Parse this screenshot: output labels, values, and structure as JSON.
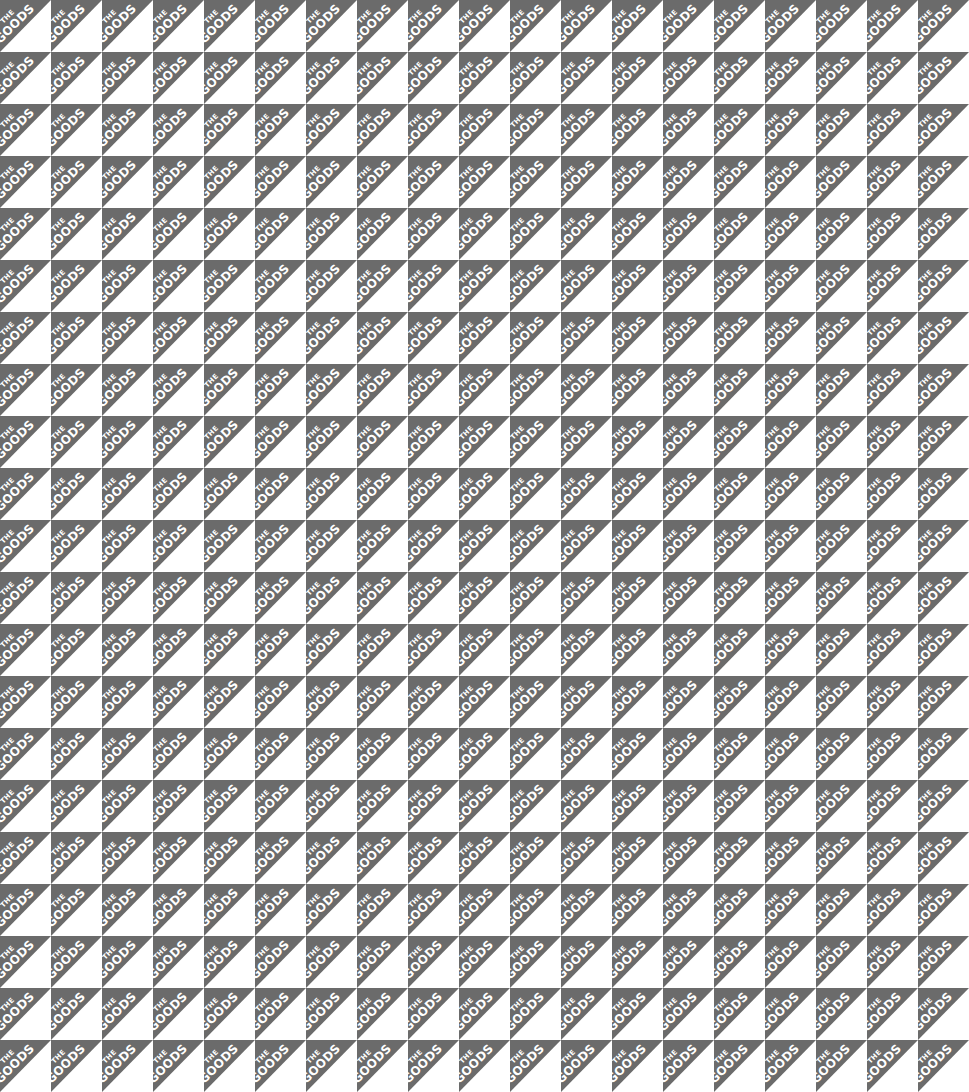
{
  "pattern": {
    "brand_line_1": "THE",
    "brand_line_2": "GOODS",
    "tile_width_px": 51,
    "tile_height_px": 52,
    "columns_visible": 19,
    "rows_visible": 21,
    "colors": {
      "grey_triangle": "#6b6b6b",
      "white_triangle": "#ffffff",
      "text": "#ffffff"
    },
    "orientation": "grey triangle upper-left, white triangle lower-right, text rotated -45deg"
  }
}
